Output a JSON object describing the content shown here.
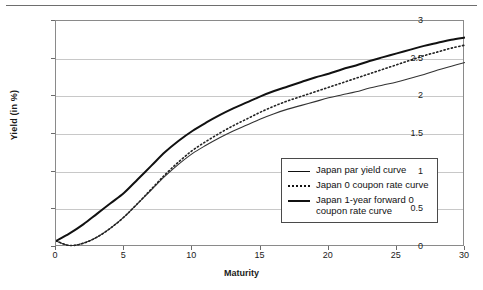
{
  "chart_data": {
    "type": "line",
    "title": "",
    "xlabel": "Maturity",
    "ylabel": "Yield (in %)",
    "xlim": [
      0,
      30
    ],
    "ylim": [
      0,
      3
    ],
    "xticks": [
      "0",
      "5",
      "10",
      "15",
      "20",
      "25",
      "30"
    ],
    "yticks": [
      "0",
      "0.5",
      "1",
      "1.5",
      "2",
      "2.5",
      "3"
    ],
    "grid": "horizontal",
    "legend_position": "bottom-right",
    "x": [
      0,
      1,
      2,
      3,
      4,
      5,
      6,
      7,
      8,
      9,
      10,
      11,
      12,
      13,
      14,
      15,
      16,
      17,
      18,
      19,
      20,
      21,
      22,
      23,
      24,
      25,
      26,
      27,
      28,
      29,
      30
    ],
    "series": [
      {
        "name": "Japan par yield curve",
        "style": "solid-thin",
        "color": "#333333",
        "values": [
          0.08,
          0.02,
          0.05,
          0.13,
          0.25,
          0.4,
          0.58,
          0.76,
          0.94,
          1.1,
          1.24,
          1.35,
          1.45,
          1.54,
          1.62,
          1.7,
          1.77,
          1.83,
          1.88,
          1.93,
          1.98,
          2.02,
          2.06,
          2.11,
          2.15,
          2.19,
          2.24,
          2.29,
          2.35,
          2.4,
          2.45
        ]
      },
      {
        "name": "Japan 0 coupon rate curve",
        "style": "dotted",
        "color": "#222222",
        "values": [
          0.08,
          0.02,
          0.05,
          0.13,
          0.25,
          0.4,
          0.58,
          0.77,
          0.96,
          1.13,
          1.28,
          1.4,
          1.51,
          1.61,
          1.7,
          1.79,
          1.87,
          1.94,
          2.0,
          2.06,
          2.12,
          2.18,
          2.24,
          2.3,
          2.36,
          2.42,
          2.48,
          2.54,
          2.59,
          2.64,
          2.68
        ]
      },
      {
        "name": "Japan 1-year forward 0 coupon rate curve",
        "style": "solid-thick",
        "color": "#111111",
        "values": [
          0.08,
          0.18,
          0.3,
          0.44,
          0.58,
          0.72,
          0.9,
          1.08,
          1.26,
          1.41,
          1.54,
          1.65,
          1.75,
          1.84,
          1.92,
          2.0,
          2.07,
          2.13,
          2.19,
          2.25,
          2.3,
          2.36,
          2.41,
          2.47,
          2.52,
          2.57,
          2.62,
          2.67,
          2.71,
          2.75,
          2.78
        ]
      }
    ]
  },
  "legend": {
    "items": [
      {
        "label": "Japan par yield curve"
      },
      {
        "label": "Japan 0 coupon rate curve"
      },
      {
        "label": "Japan 1-year forward 0 coupon rate curve"
      }
    ]
  }
}
